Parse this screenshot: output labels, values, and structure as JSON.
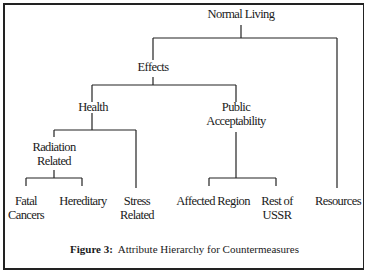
{
  "figure": {
    "caption_label": "Figure 3:",
    "caption_text": "Attribute Hierarchy for Countermeasures"
  },
  "nodes": {
    "root": {
      "line1": "Normal Living"
    },
    "effects": {
      "line1": "Effects"
    },
    "resources": {
      "line1": "Resources"
    },
    "health": {
      "line1": "Health"
    },
    "public": {
      "line1": "Public",
      "line2": "Acceptability"
    },
    "radiation": {
      "line1": "Radiation",
      "line2": "Related"
    },
    "stress": {
      "line1": "Stress",
      "line2": "Related"
    },
    "fatal": {
      "line1": "Fatal",
      "line2": "Cancers"
    },
    "hereditary": {
      "line1": "Hereditary"
    },
    "affected": {
      "line1": "Affected Region"
    },
    "rest": {
      "line1": "Rest of",
      "line2": "USSR"
    }
  },
  "hierarchy": {
    "Normal Living": [
      "Effects",
      "Resources"
    ],
    "Effects": [
      "Health",
      "Public Acceptability"
    ],
    "Health": [
      "Radiation Related",
      "Stress Related"
    ],
    "Radiation Related": [
      "Fatal Cancers",
      "Hereditary"
    ],
    "Public Acceptability": [
      "Affected Region",
      "Rest of USSR"
    ]
  }
}
